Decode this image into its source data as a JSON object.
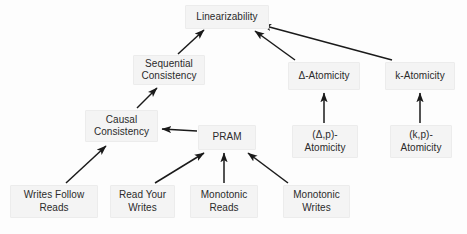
{
  "diagram": {
    "background_color": "#fdfdfd",
    "node_fill_color": "#f4f4f4",
    "node_border_color": "#ececec",
    "text_color": "#2b2b2b",
    "arrow_color": "#1a1a1a",
    "nodes": [
      {
        "id": "linearizability",
        "label": "Linearizability",
        "x": 185,
        "y": 5,
        "w": 84,
        "h": 24
      },
      {
        "id": "sequential",
        "label": "Sequential\nConsistency",
        "x": 133,
        "y": 55,
        "w": 72,
        "h": 30
      },
      {
        "id": "delta_atomicity",
        "label": "Δ-Atomicity",
        "x": 288,
        "y": 62,
        "w": 72,
        "h": 28
      },
      {
        "id": "k_atomicity",
        "label": "k-Atomicity",
        "x": 385,
        "y": 62,
        "w": 70,
        "h": 28
      },
      {
        "id": "causal",
        "label": "Causal\nConsistency",
        "x": 85,
        "y": 110,
        "w": 73,
        "h": 32
      },
      {
        "id": "pram",
        "label": "PRAM",
        "x": 198,
        "y": 125,
        "w": 58,
        "h": 25
      },
      {
        "id": "delta_p_atomicity",
        "label": "(Δ,p)-\nAtomicity",
        "x": 292,
        "y": 125,
        "w": 66,
        "h": 33
      },
      {
        "id": "k_p_atomicity",
        "label": "(k,p)-\nAtomicity",
        "x": 390,
        "y": 125,
        "w": 62,
        "h": 33
      },
      {
        "id": "writes_follow",
        "label": "Writes Follow\nReads",
        "x": 10,
        "y": 185,
        "w": 88,
        "h": 33
      },
      {
        "id": "read_your_writes",
        "label": "Read Your\nWrites",
        "x": 110,
        "y": 185,
        "w": 65,
        "h": 33
      },
      {
        "id": "monotonic_reads",
        "label": "Monotonic\nReads",
        "x": 190,
        "y": 185,
        "w": 68,
        "h": 33
      },
      {
        "id": "monotonic_writes",
        "label": "Monotonic\nWrites",
        "x": 283,
        "y": 185,
        "w": 67,
        "h": 33
      }
    ],
    "edges": [
      {
        "id": "sequential-to-linearizability",
        "from": "sequential",
        "to": "linearizability",
        "x1": 178,
        "y1": 54,
        "x2": 204,
        "y2": 30
      },
      {
        "id": "delta-atomicity-to-linearizability",
        "from": "delta_atomicity",
        "to": "linearizability",
        "x1": 295,
        "y1": 60,
        "x2": 255,
        "y2": 31
      },
      {
        "id": "k-atomicity-to-linearizability",
        "from": "k_atomicity",
        "to": "linearizability",
        "x1": 392,
        "y1": 60,
        "x2": 262,
        "y2": 25
      },
      {
        "id": "causal-to-sequential",
        "from": "causal",
        "to": "sequential",
        "x1": 137,
        "y1": 108,
        "x2": 157,
        "y2": 88
      },
      {
        "id": "pram-to-causal",
        "from": "pram",
        "to": "causal",
        "x1": 197,
        "y1": 131,
        "x2": 162,
        "y2": 129
      },
      {
        "id": "writes-follow-to-causal",
        "from": "writes_follow",
        "to": "causal",
        "x1": 66,
        "y1": 183,
        "x2": 106,
        "y2": 146
      },
      {
        "id": "read-your-writes-to-pram",
        "from": "read_your_writes",
        "to": "pram",
        "x1": 155,
        "y1": 183,
        "x2": 204,
        "y2": 153
      },
      {
        "id": "monotonic-reads-to-pram",
        "from": "monotonic_reads",
        "to": "pram",
        "x1": 224,
        "y1": 183,
        "x2": 224,
        "y2": 153
      },
      {
        "id": "monotonic-writes-to-pram",
        "from": "monotonic_writes",
        "to": "pram",
        "x1": 288,
        "y1": 183,
        "x2": 248,
        "y2": 153
      },
      {
        "id": "delta-p-to-delta-atomicity",
        "from": "delta_p_atomicity",
        "to": "delta_atomicity",
        "x1": 324,
        "y1": 123,
        "x2": 324,
        "y2": 93
      },
      {
        "id": "k-p-to-k-atomicity",
        "from": "k_p_atomicity",
        "to": "k_atomicity",
        "x1": 420,
        "y1": 123,
        "x2": 420,
        "y2": 93
      }
    ]
  }
}
